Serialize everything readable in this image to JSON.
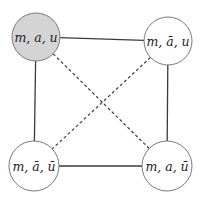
{
  "diagram": {
    "type": "graph",
    "colors": {
      "edge": "#3a3a3a",
      "node_border": "#7a7a7a",
      "node_fill_default": "#ffffff",
      "node_fill_highlight": "#d4d4d4",
      "text": "#222222"
    },
    "nodes": [
      {
        "id": "n1",
        "label": "m, a, u",
        "label_display": "m, a, u",
        "cx": 36,
        "cy": 37,
        "r": 24,
        "highlighted": true
      },
      {
        "id": "n2",
        "label": "m, ā, u",
        "label_display": "m, ā, u",
        "cx": 168,
        "cy": 41,
        "r": 24,
        "highlighted": false
      },
      {
        "id": "n3",
        "label": "m, ā, ū",
        "label_display": "m, ā, ū",
        "cx": 34,
        "cy": 166,
        "r": 25,
        "highlighted": false
      },
      {
        "id": "n4",
        "label": "m, a, ū",
        "label_display": "m, a, ū",
        "cx": 167,
        "cy": 166,
        "r": 25,
        "highlighted": false
      }
    ],
    "edges": [
      {
        "from": "n1",
        "to": "n2",
        "style": "solid"
      },
      {
        "from": "n1",
        "to": "n3",
        "style": "solid"
      },
      {
        "from": "n2",
        "to": "n4",
        "style": "solid"
      },
      {
        "from": "n3",
        "to": "n4",
        "style": "solid"
      },
      {
        "from": "n1",
        "to": "n4",
        "style": "dashed"
      },
      {
        "from": "n2",
        "to": "n3",
        "style": "dashed"
      }
    ]
  }
}
